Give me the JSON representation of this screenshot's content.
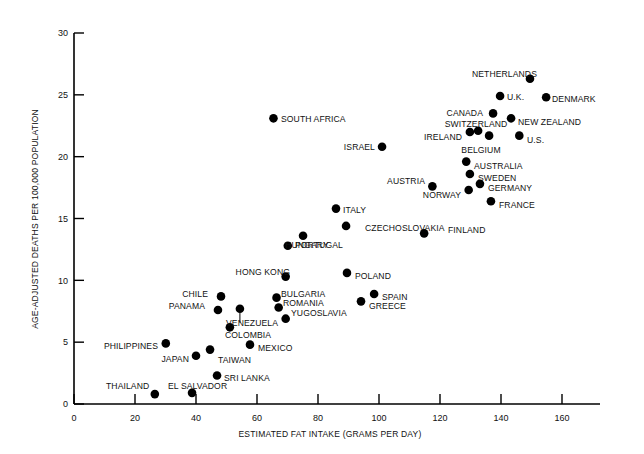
{
  "chart_data": {
    "type": "scatter",
    "title": "",
    "xlabel": "ESTIMATED FAT INTAKE (GRAMS PER DAY)",
    "ylabel": "AGE-ADJUSTED DEATHS PER 100,000 POPULATION",
    "xlim": [
      0,
      170
    ],
    "ylim": [
      0,
      30
    ],
    "xticks": [
      0,
      20,
      40,
      60,
      80,
      100,
      120,
      140,
      160
    ],
    "yticks": [
      0,
      5,
      10,
      15,
      20,
      25,
      30
    ],
    "grid": false,
    "legend": "none",
    "points": [
      {
        "label": "THAILAND",
        "x": 26.5,
        "y": 0.8,
        "lx": 106,
        "ly": 386,
        "anchor": "start",
        "leader": false
      },
      {
        "label": "EL SALVADOR",
        "x": 38.7,
        "y": 0.9,
        "lx": 168,
        "ly": 386,
        "anchor": "start",
        "leader": false
      },
      {
        "label": "SRI LANKA",
        "x": 46.9,
        "y": 2.3,
        "lx": 224,
        "ly": 378,
        "anchor": "start",
        "leader": false
      },
      {
        "label": "PHILIPPINES",
        "x": 30.1,
        "y": 4.9,
        "lx": 158,
        "ly": 346,
        "anchor": "end",
        "leader": false
      },
      {
        "label": "JAPAN",
        "x": 40.0,
        "y": 3.9,
        "lx": 189,
        "ly": 359,
        "anchor": "end",
        "leader": false
      },
      {
        "label": "TAIWAN",
        "x": 44.6,
        "y": 4.4,
        "lx": 218,
        "ly": 360,
        "anchor": "start",
        "leader": false
      },
      {
        "label": "MEXICO",
        "x": 57.7,
        "y": 4.8,
        "lx": 258,
        "ly": 348,
        "anchor": "start",
        "leader": false
      },
      {
        "label": "COLOMBIA",
        "x": 51.1,
        "y": 6.2,
        "lx": 225,
        "ly": 335,
        "anchor": "start",
        "leader": false
      },
      {
        "label": "VENEZUELA",
        "x": 54.4,
        "y": 7.7,
        "lx": 226,
        "ly": 323,
        "anchor": "start",
        "leader": true
      },
      {
        "label": "CHILE",
        "x": 48.2,
        "y": 8.7,
        "lx": 208,
        "ly": 294,
        "anchor": "end",
        "leader": false
      },
      {
        "label": "PANAMA",
        "x": 47.2,
        "y": 7.6,
        "lx": 205,
        "ly": 306,
        "anchor": "end",
        "leader": false
      },
      {
        "label": "BULGARIA",
        "x": 66.4,
        "y": 8.6,
        "lx": 281,
        "ly": 294,
        "anchor": "start",
        "leader": false
      },
      {
        "label": "ROMANIA",
        "x": 67.1,
        "y": 7.8,
        "lx": 283,
        "ly": 303,
        "anchor": "start",
        "leader": false
      },
      {
        "label": "YUGOSLAVIA",
        "x": 69.4,
        "y": 6.9,
        "lx": 291,
        "ly": 313,
        "anchor": "start",
        "leader": false
      },
      {
        "label": "HONG KONG",
        "x": 69.4,
        "y": 10.3,
        "lx": 290,
        "ly": 272,
        "anchor": "end",
        "leader": false
      },
      {
        "label": "POLAND",
        "x": 89.5,
        "y": 10.6,
        "lx": 355,
        "ly": 276,
        "anchor": "start",
        "leader": false
      },
      {
        "label": "SPAIN",
        "x": 98.4,
        "y": 8.9,
        "lx": 382,
        "ly": 297,
        "anchor": "start",
        "leader": false
      },
      {
        "label": "GREECE",
        "x": 94.1,
        "y": 8.3,
        "lx": 369,
        "ly": 306,
        "anchor": "start",
        "leader": false
      },
      {
        "label": "PORTUGAL",
        "x": 70.1,
        "y": 12.8,
        "lx": 295,
        "ly": 245,
        "anchor": "start",
        "leader": false
      },
      {
        "label": "HUNGARY",
        "x": 75.1,
        "y": 13.6,
        "lx": 307,
        "ly": 245,
        "anchor": "middle",
        "leader": false
      },
      {
        "label": "ITALY",
        "x": 85.9,
        "y": 15.8,
        "lx": 343,
        "ly": 210,
        "anchor": "start",
        "leader": false
      },
      {
        "label": "CZECHOSLOVAKIA",
        "x": 89.2,
        "y": 14.4,
        "lx": 365,
        "ly": 228,
        "anchor": "start",
        "leader": false
      },
      {
        "label": "FINLAND",
        "x": 114.8,
        "y": 13.8,
        "lx": 448,
        "ly": 230,
        "anchor": "start",
        "leader": false
      },
      {
        "label": "ISRAEL",
        "x": 101.0,
        "y": 20.8,
        "lx": 375,
        "ly": 147,
        "anchor": "end",
        "leader": false
      },
      {
        "label": "SOUTH AFRICA",
        "x": 65.4,
        "y": 23.1,
        "lx": 281,
        "ly": 119,
        "anchor": "start",
        "leader": false
      },
      {
        "label": "AUSTRIA",
        "x": 117.5,
        "y": 17.6,
        "lx": 425,
        "ly": 181,
        "anchor": "end",
        "leader": false
      },
      {
        "label": "NORWAY",
        "x": 129.4,
        "y": 17.3,
        "lx": 461,
        "ly": 195,
        "anchor": "end",
        "leader": false
      },
      {
        "label": "AUSTRALIA",
        "x": 128.6,
        "y": 19.6,
        "lx": 474,
        "ly": 166,
        "anchor": "start",
        "leader": false
      },
      {
        "label": "SWEDEN",
        "x": 129.8,
        "y": 18.6,
        "lx": 478,
        "ly": 178,
        "anchor": "start",
        "leader": false
      },
      {
        "label": "GERMANY",
        "x": 133.1,
        "y": 17.8,
        "lx": 488,
        "ly": 188,
        "anchor": "start",
        "leader": false
      },
      {
        "label": "FRANCE",
        "x": 136.7,
        "y": 16.4,
        "lx": 499,
        "ly": 205,
        "anchor": "start",
        "leader": false
      },
      {
        "label": "BELGIUM",
        "x": 136.1,
        "y": 21.7,
        "lx": 481,
        "ly": 150,
        "anchor": "middle",
        "leader": false
      },
      {
        "label": "U.S.",
        "x": 146.0,
        "y": 21.7,
        "lx": 527,
        "ly": 140,
        "anchor": "start",
        "leader": false
      },
      {
        "label": "SWITZERLAND",
        "x": 132.5,
        "y": 22.1,
        "lx": 476,
        "ly": 124,
        "anchor": "middle",
        "leader": false
      },
      {
        "label": "IRELAND",
        "x": 129.8,
        "y": 22.0,
        "lx": 462,
        "ly": 137,
        "anchor": "end",
        "leader": false
      },
      {
        "label": "CANADA",
        "x": 137.4,
        "y": 23.5,
        "lx": 483,
        "ly": 113,
        "anchor": "end",
        "leader": false
      },
      {
        "label": "NEW ZEALAND",
        "x": 143.3,
        "y": 23.1,
        "lx": 518,
        "ly": 122,
        "anchor": "start",
        "leader": false
      },
      {
        "label": "U.K.",
        "x": 139.7,
        "y": 24.9,
        "lx": 507,
        "ly": 97,
        "anchor": "start",
        "leader": false
      },
      {
        "label": "DENMARK",
        "x": 154.8,
        "y": 24.8,
        "lx": 552,
        "ly": 99,
        "anchor": "start",
        "leader": false
      },
      {
        "label": "NETHERLANDS",
        "x": 149.5,
        "y": 26.3,
        "lx": 537,
        "ly": 74,
        "anchor": "end",
        "leader": false
      }
    ]
  }
}
